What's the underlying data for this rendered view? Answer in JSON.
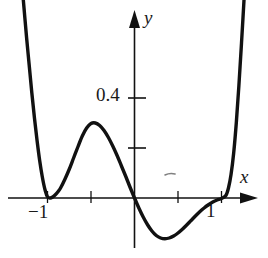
{
  "figure": {
    "kind": "cartesian-graph",
    "background_color": "#ffffff",
    "ink_color": "#111111"
  },
  "axes": {
    "x_axis": {
      "label": "x",
      "arrow": true,
      "tick_labels": [
        "-1",
        "1"
      ]
    },
    "y_axis": {
      "label": "y",
      "arrow": true,
      "tick_labels": [
        "0.4"
      ]
    }
  },
  "labels": {
    "y_tick_04": "0.4",
    "x_tick_neg1": "−1",
    "x_tick_pos1": "1",
    "axis_x": "x",
    "axis_y": "y"
  },
  "chart_data": {
    "type": "line",
    "title": "",
    "subtitle": "",
    "xlabel": "x",
    "ylabel": "y",
    "xlim": [
      -1.45,
      1.35
    ],
    "ylim": [
      -0.28,
      0.95
    ],
    "grid": false,
    "legend": null,
    "axis_style": "arrow-tipped crossed axes through origin",
    "x_ticks": [
      -1,
      -0.5,
      0.5,
      1
    ],
    "x_tick_labels": [
      "-1",
      "",
      "",
      "1"
    ],
    "y_ticks": [
      0.2,
      0.4
    ],
    "y_tick_labels": [
      "",
      "0.4"
    ],
    "series": [
      {
        "name": "curve",
        "color": "#111111",
        "x": [
          -1.3,
          -1.27,
          -1.24,
          -1.21,
          -1.18,
          -1.15,
          -1.12,
          -1.09,
          -1.06,
          -1.03,
          -1.0,
          -0.97,
          -0.94,
          -0.91,
          -0.88,
          -0.85,
          -0.8,
          -0.75,
          -0.7,
          -0.65,
          -0.6,
          -0.55,
          -0.5,
          -0.45,
          -0.4,
          -0.35,
          -0.3,
          -0.25,
          -0.2,
          -0.15,
          -0.1,
          -0.05,
          0.0,
          0.05,
          0.1,
          0.15,
          0.2,
          0.25,
          0.3,
          0.35,
          0.4,
          0.45,
          0.5,
          0.55,
          0.6,
          0.65,
          0.7,
          0.75,
          0.8,
          0.85,
          0.9,
          0.95,
          1.0,
          1.05,
          1.08,
          1.11,
          1.14,
          1.17,
          1.2,
          1.23,
          1.26
        ],
        "y": [
          0.88,
          0.76,
          0.64,
          0.53,
          0.42,
          0.32,
          0.23,
          0.15,
          0.085,
          0.035,
          0.005,
          0.0,
          0.004,
          0.013,
          0.025,
          0.04,
          0.075,
          0.115,
          0.16,
          0.205,
          0.248,
          0.28,
          0.298,
          0.3,
          0.29,
          0.27,
          0.242,
          0.208,
          0.17,
          0.128,
          0.086,
          0.042,
          0.0,
          -0.04,
          -0.076,
          -0.107,
          -0.132,
          -0.15,
          -0.16,
          -0.163,
          -0.16,
          -0.152,
          -0.14,
          -0.125,
          -0.108,
          -0.09,
          -0.072,
          -0.055,
          -0.04,
          -0.027,
          -0.016,
          -0.008,
          -0.002,
          0.01,
          0.04,
          0.095,
          0.18,
          0.3,
          0.45,
          0.62,
          0.8
        ]
      }
    ],
    "annotations": [
      {
        "name": "double-root-left",
        "x": -1.0,
        "y": 0.0,
        "note": "curve touches x-axis"
      },
      {
        "name": "local-maximum",
        "x": -0.45,
        "y": 0.3,
        "note": "hump below 0.4"
      },
      {
        "name": "root-origin",
        "x": 0.0,
        "y": 0.0,
        "note": "crosses near origin"
      },
      {
        "name": "local-minimum",
        "x": 0.35,
        "y": -0.163,
        "note": "dip below axis"
      },
      {
        "name": "near-root-right",
        "x": 1.0,
        "y": 0.0,
        "note": "curve approaches axis near x=1"
      },
      {
        "name": "smudge",
        "x": 0.52,
        "y": 0.105,
        "note": "faint scan artifact mark"
      }
    ]
  }
}
